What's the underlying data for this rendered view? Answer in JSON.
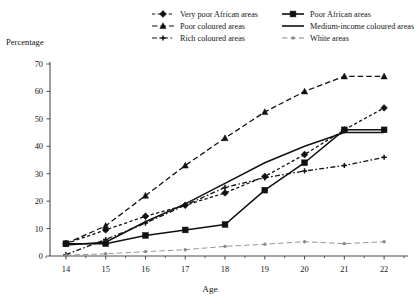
{
  "chart_data": {
    "type": "line",
    "title": "",
    "xlabel": "Age",
    "ylabel": "Percentage",
    "x": [
      14,
      15,
      16,
      17,
      18,
      19,
      20,
      21,
      22
    ],
    "xlim": [
      13.6,
      22.5
    ],
    "ylim": [
      0,
      70
    ],
    "yticks": [
      0,
      10,
      20,
      30,
      40,
      50,
      60,
      70
    ],
    "xticks": [
      14,
      15,
      16,
      17,
      18,
      19,
      20,
      21,
      22
    ],
    "grid": false,
    "legend_position": "top",
    "axis_color": "#4d4d4d",
    "line_color": "#111111",
    "white_areas_color": "#8a8a8a",
    "series": [
      {
        "name": "Very poor African areas",
        "marker": "diamond",
        "dash": "dotted",
        "values": [
          4.5,
          9.5,
          14.5,
          18.5,
          23,
          29,
          37,
          46,
          54
        ]
      },
      {
        "name": "Poor African areas",
        "marker": "square",
        "dash": "solid",
        "values": [
          4.5,
          4.5,
          7.5,
          9.5,
          11.5,
          24,
          34,
          46,
          46
        ]
      },
      {
        "name": "Poor coloured areas",
        "marker": "triangle",
        "dash": "dashed",
        "values": [
          4.5,
          11,
          22,
          33,
          43,
          52.5,
          60,
          65.5,
          65.5
        ]
      },
      {
        "name": "Medium-income coloured areas",
        "marker": "none",
        "dash": "solid",
        "values": [
          4,
          5,
          12.5,
          19,
          26.5,
          34,
          40,
          45,
          45
        ]
      },
      {
        "name": "Rich coloured areas",
        "marker": "cross",
        "dash": "dashdot",
        "values": [
          0.5,
          6,
          12,
          18.5,
          25,
          28.5,
          31,
          33,
          36
        ]
      },
      {
        "name": "White areas",
        "marker": "dot",
        "dash": "dashed",
        "values": [
          0.3,
          0.8,
          1.6,
          2.3,
          3.5,
          4.3,
          5.2,
          4.5,
          5.2
        ]
      }
    ]
  },
  "legend": {
    "items": [
      {
        "label": "Very poor African areas",
        "key": "legend-item-very-poor-african-areas"
      },
      {
        "label": "Poor African areas",
        "key": "legend-item-poor-african-areas"
      },
      {
        "label": "Poor coloured areas",
        "key": "legend-item-poor-coloured-areas"
      },
      {
        "label": "Medium-income coloured areas",
        "key": "legend-item-medium-income-coloured-areas"
      },
      {
        "label": "Rich coloured areas",
        "key": "legend-item-rich-coloured-areas"
      },
      {
        "label": "White areas",
        "key": "legend-item-white-areas"
      }
    ]
  },
  "axes": {
    "y_axis_title": "Percentage",
    "x_axis_title": "Age",
    "y_tick_labels": [
      "0",
      "10",
      "20",
      "30",
      "40",
      "50",
      "60",
      "70"
    ],
    "x_tick_labels": [
      "14",
      "15",
      "16",
      "17",
      "18",
      "19",
      "20",
      "21",
      "22"
    ]
  }
}
